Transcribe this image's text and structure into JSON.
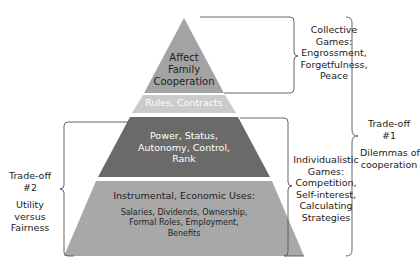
{
  "diagram": {
    "type": "pyramid",
    "layers": [
      {
        "id": "top",
        "lines": [
          "Affect",
          "Family",
          "Cooperation"
        ],
        "color": "#a3a3a3"
      },
      {
        "id": "rules",
        "lines": [
          "Rules, Contracts"
        ],
        "color": "#cbcbcb"
      },
      {
        "id": "power",
        "lines": [
          "Power, Status,",
          "Autonomy, Control,",
          "Rank"
        ],
        "color": "#6a6a6a"
      },
      {
        "id": "instrumental",
        "heading": "Instrumental, Economic Uses:",
        "lines": [
          "Salaries, Dividends, Ownership,",
          "Formal Roles, Employment,",
          "Benefits"
        ],
        "color": "#a8a8a8"
      }
    ],
    "right_labels": {
      "collective": [
        "Collective",
        "Games:",
        "Engrossment,",
        "Forgetfulness,",
        "Peace"
      ],
      "individualistic": [
        "Individualistic",
        "Games:",
        "Competition,",
        "Self-interest,",
        "Calculating",
        "Strategies"
      ]
    },
    "tradeoff1": {
      "title": [
        "Trade-off",
        "#1"
      ],
      "desc": [
        "Dilemmas of",
        "cooperation"
      ]
    },
    "tradeoff2": {
      "title": [
        "Trade-off",
        "#2"
      ],
      "desc": [
        "Utility",
        "versus",
        "Fairness"
      ]
    },
    "colors": {
      "bracket": "#555555",
      "text_dark": "#1e1e1e",
      "text_light": "#ffffff"
    }
  }
}
